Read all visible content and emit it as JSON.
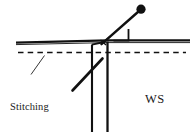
{
  "figure": {
    "kind": "sewing-technique-line-drawing",
    "background_color": "#ffffff",
    "ink_color": "#111111",
    "width": 196,
    "height": 132
  },
  "labels": {
    "stitching_line": {
      "line1": "Stitching",
      "line2": "line"
    },
    "wrong_side": "WS"
  },
  "elements": {
    "fabric_edge_label": "fabric-edge",
    "stitching_line_label": "stitching-line-dashed",
    "pin_label": "pin-needle",
    "pin_head_label": "pin-head",
    "thread_label": "thread-diagonal",
    "seam_fold_label": "seam-fold-vertical",
    "leader_label": "leader-line"
  }
}
